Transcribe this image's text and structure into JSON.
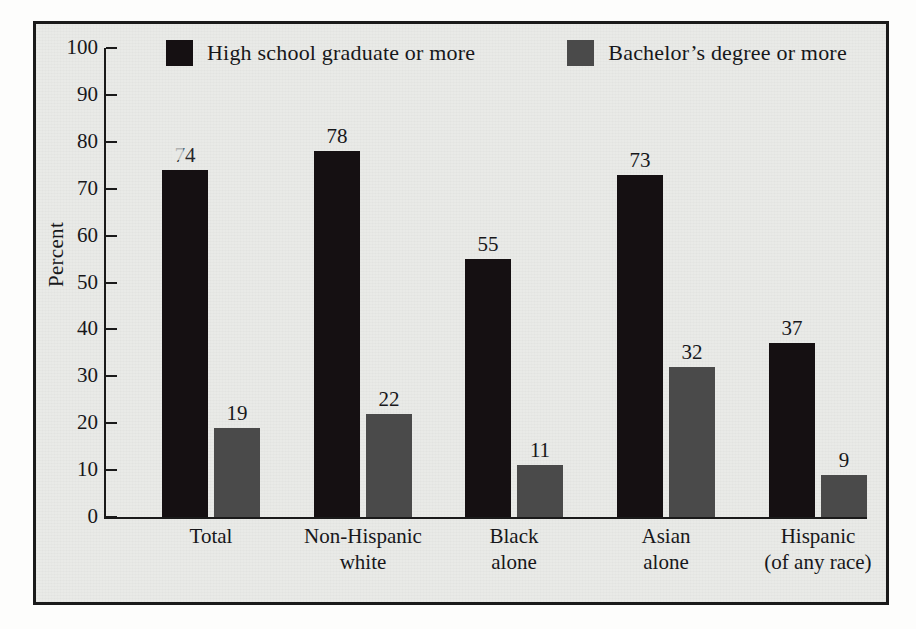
{
  "chart_data": {
    "type": "bar",
    "title": "",
    "subtitle": "",
    "xlabel": "",
    "ylabel": "Percent",
    "ylim": [
      0,
      100
    ],
    "ytick_step": 10,
    "yticks": [
      100,
      90,
      80,
      70,
      60,
      50,
      40,
      30,
      20,
      10,
      0
    ],
    "grid": false,
    "legend_position": "top",
    "categories": [
      "Total",
      "Non-Hispanic\nwhite",
      "Black\nalone",
      "Asian\nalone",
      "Hispanic\n(of any race)"
    ],
    "category_lines": [
      [
        "Total"
      ],
      [
        "Non-Hispanic",
        "white"
      ],
      [
        "Black",
        "alone"
      ],
      [
        "Asian",
        "alone"
      ],
      [
        "Hispanic",
        "(of any race)"
      ]
    ],
    "series": [
      {
        "name": "High school graduate or more",
        "color": "#151012",
        "values": [
          74,
          78,
          55,
          73,
          37
        ],
        "value_labels": [
          "74",
          "78",
          "55",
          "73",
          "37"
        ]
      },
      {
        "name": "Bachelor's degree or more",
        "color": "#4a4a4a",
        "values": [
          19,
          22,
          11,
          32,
          9
        ],
        "value_labels": [
          "19",
          "22",
          "11",
          "32",
          "9"
        ]
      }
    ]
  },
  "legend": {
    "entries": [
      {
        "label": "High school graduate or more",
        "color": "#151012"
      },
      {
        "label": "Bachelor’s degree or more",
        "color": "#4a4a4a"
      }
    ]
  },
  "axis": {
    "y_title": "Percent",
    "tick_labels": [
      "100",
      "90",
      "80",
      "70",
      "60",
      "50",
      "40",
      "30",
      "20",
      "10",
      "0"
    ]
  },
  "colors": {
    "series_dark": "#151012",
    "series_gray": "#4a4a4a",
    "frame": "#1a1a1a",
    "plot_background": "#e9eae7",
    "page_background": "#fdfdfc",
    "text": "#17171a"
  }
}
